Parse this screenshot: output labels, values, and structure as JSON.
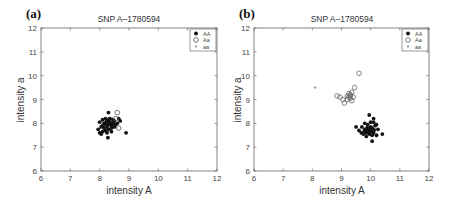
{
  "chart_data": [
    {
      "panel": "(a)",
      "type": "scatter",
      "title": "SNP A–1780594",
      "xlabel": "intensity A",
      "ylabel": "intensity a",
      "xlim": [
        6,
        12
      ],
      "ylim": [
        6,
        12
      ],
      "xticks": [
        6,
        7,
        8,
        9,
        10,
        11,
        12
      ],
      "yticks": [
        6,
        7,
        8,
        9,
        10,
        11,
        12
      ],
      "grid": false,
      "legend_position": "upper right",
      "legend": [
        "AA",
        "Aa",
        "aa"
      ],
      "series": [
        {
          "name": "AA",
          "marker": "filled-dot",
          "color": "#111111",
          "points": [
            [
              8.3,
              8.45
            ],
            [
              8.0,
              8.05
            ],
            [
              8.1,
              7.9
            ],
            [
              8.2,
              8.0
            ],
            [
              8.25,
              8.1
            ],
            [
              8.3,
              7.95
            ],
            [
              8.35,
              8.05
            ],
            [
              8.4,
              7.9
            ],
            [
              8.15,
              7.8
            ],
            [
              8.2,
              7.7
            ],
            [
              8.3,
              7.75
            ],
            [
              8.4,
              7.8
            ],
            [
              8.45,
              8.0
            ],
            [
              8.5,
              8.1
            ],
            [
              8.55,
              7.95
            ],
            [
              8.1,
              8.15
            ],
            [
              8.2,
              8.2
            ],
            [
              8.35,
              8.2
            ],
            [
              8.45,
              8.15
            ],
            [
              8.0,
              7.6
            ],
            [
              7.95,
              7.75
            ],
            [
              8.05,
              7.55
            ],
            [
              8.25,
              7.6
            ],
            [
              8.28,
              7.4
            ],
            [
              8.15,
              8.0
            ],
            [
              8.3,
              8.1
            ],
            [
              8.25,
              7.85
            ],
            [
              8.35,
              7.95
            ],
            [
              8.6,
              8.0
            ],
            [
              8.7,
              8.1
            ],
            [
              8.65,
              8.2
            ],
            [
              8.5,
              7.85
            ],
            [
              8.4,
              7.65
            ],
            [
              8.1,
              7.65
            ],
            [
              8.18,
              7.95
            ],
            [
              8.22,
              8.05
            ],
            [
              8.38,
              8.0
            ],
            [
              8.9,
              7.6
            ],
            [
              8.05,
              7.85
            ],
            [
              8.32,
              8.18
            ]
          ]
        },
        {
          "name": "Aa",
          "marker": "open-circle",
          "color": "#555555",
          "points": [
            [
              8.6,
              8.45
            ],
            [
              8.65,
              7.8
            ],
            [
              8.55,
              8.2
            ]
          ]
        },
        {
          "name": "aa",
          "marker": "small-dot",
          "color": "#888888",
          "points": []
        }
      ]
    },
    {
      "panel": "(b)",
      "type": "scatter",
      "title": "SNP A–1780594",
      "xlabel": "intensity A",
      "ylabel": "intensity a",
      "xlim": [
        6,
        12
      ],
      "ylim": [
        6,
        12
      ],
      "xticks": [
        6,
        7,
        8,
        9,
        10,
        11,
        12
      ],
      "yticks": [
        6,
        7,
        8,
        9,
        10,
        11,
        12
      ],
      "grid": false,
      "legend_position": "upper right",
      "legend": [
        "AA",
        "Aa",
        "aa"
      ],
      "series": [
        {
          "name": "AA",
          "marker": "filled-dot",
          "color": "#111111",
          "points": [
            [
              9.95,
              8.35
            ],
            [
              10.1,
              8.2
            ],
            [
              9.7,
              7.85
            ],
            [
              9.8,
              7.75
            ],
            [
              9.9,
              7.7
            ],
            [
              10.0,
              7.65
            ],
            [
              10.05,
              7.8
            ],
            [
              10.15,
              7.9
            ],
            [
              10.2,
              7.95
            ],
            [
              9.85,
              7.6
            ],
            [
              9.95,
              7.55
            ],
            [
              10.05,
              7.5
            ],
            [
              10.1,
              7.6
            ],
            [
              10.0,
              7.85
            ],
            [
              9.9,
              7.95
            ],
            [
              9.8,
              8.0
            ],
            [
              10.0,
              8.05
            ],
            [
              10.1,
              8.05
            ],
            [
              9.75,
              7.55
            ],
            [
              9.85,
              7.45
            ],
            [
              10.05,
              7.25
            ],
            [
              9.6,
              7.7
            ],
            [
              9.5,
              7.85
            ],
            [
              10.4,
              7.55
            ],
            [
              10.25,
              7.75
            ],
            [
              9.95,
              7.75
            ],
            [
              9.88,
              7.82
            ],
            [
              10.02,
              7.68
            ],
            [
              9.92,
              7.62
            ],
            [
              10.12,
              7.72
            ],
            [
              9.78,
              7.68
            ],
            [
              10.2,
              7.5
            ],
            [
              9.68,
              7.6
            ]
          ]
        },
        {
          "name": "Aa",
          "marker": "open-circle",
          "color": "#666666",
          "points": [
            [
              9.6,
              10.1
            ],
            [
              9.45,
              9.5
            ],
            [
              8.85,
              9.15
            ],
            [
              8.95,
              9.1
            ],
            [
              9.05,
              9.0
            ],
            [
              9.1,
              8.85
            ],
            [
              9.2,
              9.15
            ],
            [
              9.25,
              9.25
            ],
            [
              9.3,
              9.2
            ],
            [
              9.35,
              9.3
            ],
            [
              9.4,
              9.1
            ],
            [
              9.3,
              9.05
            ],
            [
              9.2,
              9.0
            ],
            [
              9.35,
              8.95
            ],
            [
              9.25,
              9.1
            ],
            [
              9.3,
              9.15
            ]
          ]
        },
        {
          "name": "aa",
          "marker": "small-dot",
          "color": "#888888",
          "points": [
            [
              8.1,
              9.5
            ]
          ]
        }
      ]
    }
  ]
}
